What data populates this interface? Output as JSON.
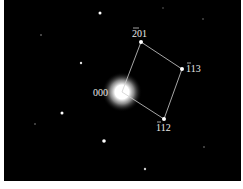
{
  "figure": {
    "type": "electron diffraction pattern",
    "labels": {
      "origin": "000",
      "spot_a": "201",
      "spot_a_bar": "2",
      "spot_b": "113",
      "spot_b_bar": "1",
      "spot_c": "112"
    },
    "colors": {
      "background": "#000000",
      "spots": "#ffffff",
      "lines": "#d0d0d0"
    }
  }
}
